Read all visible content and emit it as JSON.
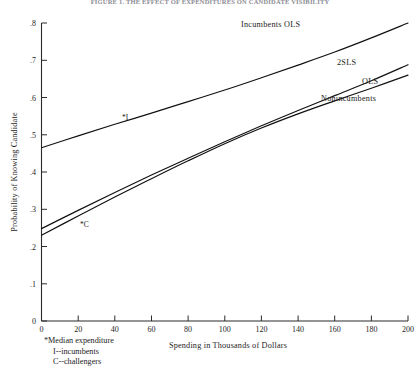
{
  "figure": {
    "title": "FIGURE 1. THE EFFECT OF EXPENDITURES ON CANDIDATE VISIBILITY"
  },
  "chart_data": {
    "type": "line",
    "title": "FIGURE 1. THE EFFECT OF EXPENDITURES ON CANDIDATE VISIBILITY",
    "xlabel": "Spending in Thousands of Dollars",
    "ylabel": "Probability of Knowing Candidate",
    "xlim": [
      0,
      200
    ],
    "ylim": [
      0,
      0.8
    ],
    "grid": false,
    "legend_position": "inline-curve-labels",
    "x_ticks": [
      0,
      20,
      40,
      60,
      80,
      100,
      120,
      140,
      160,
      180,
      200
    ],
    "x_tick_labels": [
      "0",
      "20",
      "40",
      "60",
      "80",
      "100",
      "120",
      "140",
      "160",
      "180",
      "200"
    ],
    "y_ticks": [
      0,
      0.1,
      0.2,
      0.3,
      0.4,
      0.5,
      0.6,
      0.7,
      0.8
    ],
    "y_tick_labels": [
      "0",
      ".1",
      ".2",
      ".3",
      ".4",
      ".5",
      ".6",
      ".7",
      ".8"
    ],
    "x": [
      0,
      20,
      40,
      60,
      80,
      100,
      120,
      140,
      160,
      180,
      200
    ],
    "series": [
      {
        "name": "Incumbents OLS",
        "label": "Incumbents  OLS",
        "values": [
          0.465,
          0.497,
          0.528,
          0.558,
          0.589,
          0.62,
          0.653,
          0.687,
          0.722,
          0.76,
          0.8
        ]
      },
      {
        "name": "Nonincumbents 2SLS",
        "label": "2SLS",
        "values": [
          0.248,
          0.297,
          0.345,
          0.392,
          0.437,
          0.481,
          0.524,
          0.565,
          0.605,
          0.645,
          0.688
        ]
      },
      {
        "name": "Nonincumbents OLS",
        "label": "OLS",
        "values": [
          0.23,
          0.282,
          0.333,
          0.382,
          0.43,
          0.476,
          0.518,
          0.556,
          0.591,
          0.625,
          0.66
        ]
      }
    ],
    "group_label": "Nonincumbents",
    "annotations": [
      {
        "name": "median-expenditure-incumbents",
        "text": "*I",
        "x": 47,
        "y": 0.538,
        "note": "Median expenditure, incumbents"
      },
      {
        "name": "median-expenditure-challengers",
        "text": "*C",
        "x": 25,
        "y": 0.262,
        "note": "Median expenditure, challengers"
      }
    ]
  },
  "footnote": {
    "line1": "*Median expenditure",
    "line2": "I--incumbents",
    "line3": "C--challengers"
  }
}
